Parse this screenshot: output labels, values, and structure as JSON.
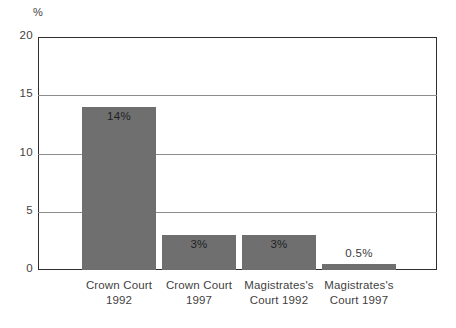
{
  "chart_data": {
    "type": "bar",
    "title": "",
    "subtitle": "",
    "xlabel": "",
    "ylabel": "%",
    "ylim": [
      0,
      20
    ],
    "yticks": [
      "0",
      "5",
      "10",
      "15",
      "20"
    ],
    "ytick_values": [
      0,
      5,
      10,
      15,
      20
    ],
    "grid": true,
    "legend": false,
    "legend_position": "none",
    "categories": [
      "Crown Court 1992",
      "Crown Court 1997",
      "Magistrates's Court 1992",
      "Magistrates's Court 1997"
    ],
    "category_lines": [
      {
        "line1": "Crown Court",
        "line2": "1992"
      },
      {
        "line1": "Crown Court",
        "line2": "1997"
      },
      {
        "line1": "Magistrates's",
        "line2": "Court 1992"
      },
      {
        "line1": "Magistrates's",
        "line2": "Court 1997"
      }
    ],
    "values": [
      14,
      3,
      3,
      0.5
    ],
    "value_labels": [
      "14%",
      "3%",
      "3%",
      "0.5%"
    ],
    "bar_color": "#6f6f6f",
    "axis_color": "#2e2e2e",
    "gridline_color": "#8d8d8d",
    "background_color": "#ffffff",
    "text_color": "#3f3f3f"
  }
}
